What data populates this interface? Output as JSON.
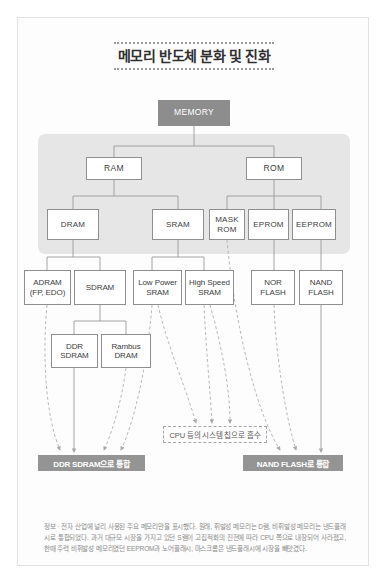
{
  "title": "메모리 반도체 분화 및 진화",
  "root": {
    "label": "MEMORY"
  },
  "level1": [
    {
      "label": "RAM"
    },
    {
      "label": "ROM"
    }
  ],
  "level2": [
    {
      "label": "DRAM"
    },
    {
      "label": "SRAM"
    },
    {
      "label": "MASK\nROM"
    },
    {
      "label": "EPROM"
    },
    {
      "label": "EEPROM"
    }
  ],
  "level3": [
    {
      "label": "ADRAM\n(FP, EDO)"
    },
    {
      "label": "SDRAM"
    },
    {
      "label": "Low Power\nSRAM"
    },
    {
      "label": "High Speed\nSRAM"
    },
    {
      "label": "NOR\nFLASH"
    },
    {
      "label": "NAND\nFLASH"
    }
  ],
  "level4": [
    {
      "label": "DDR\nSDRAM"
    },
    {
      "label": "Rambus\nDRAM"
    }
  ],
  "callout": {
    "label": "CPU 등의 시스템 칩으로 흡수"
  },
  "banners": [
    {
      "label": "DDR SDRAM으로 통합"
    },
    {
      "label": "NAND FLASH로 통합"
    }
  ],
  "caption": "정보 · 전자 산업에 널리 사용된 주요 메모리만을 표시했다. 원래, 휘발성 메모리는 D램, 비휘발성 메모리는 낸드플래시로 통합되었다. 과거 대규모 시장을 가지고 있던 S램이 고집적화의 진전에 따라 CPU 쪽으로 내장되어 사라졌고, 한때 주력 비휘발성 메모리였던 EEPROM과 노어플래시, 마스크롬은 낸드플래시에 시장을 빼앗겼다.",
  "colors": {
    "root_fill": "#8d8d8d",
    "band_fill": "#e6e6e6",
    "banner_fill": "#949494",
    "node_border": "#8f8f8f",
    "link": "#9a9a9a",
    "dashed": "#b0b0b0"
  }
}
